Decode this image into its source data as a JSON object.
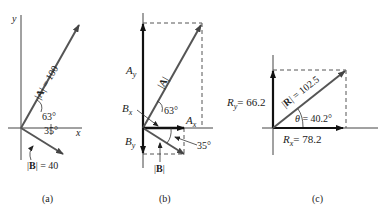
{
  "figure": {
    "panels": [
      {
        "id": "a",
        "caption": "(a)",
        "axis_labels": {
          "x": "x",
          "y": "y"
        },
        "vectors": [
          {
            "name": "A",
            "label": "|A| = 100",
            "magnitude": 100,
            "angle_deg": 63
          },
          {
            "name": "B",
            "label": "|B| = 40",
            "magnitude": 40,
            "angle_deg": -35
          }
        ],
        "angle_labels": [
          "63°",
          "35°"
        ],
        "labels": {
          "A_mag": "|A| = 100",
          "B_mag": "|B| = 40",
          "angle_A": "63°",
          "angle_B": "35°"
        }
      },
      {
        "id": "b",
        "caption": "(b)",
        "labels": {
          "Ay": "A",
          "Ay_sub": "y",
          "Bx": "B",
          "Bx_sub": "x",
          "Ax": "A",
          "Ax_sub": "x",
          "By": "B",
          "By_sub": "y",
          "A_mag": "|A|",
          "B_mag": "|B|",
          "angle_A": "63°",
          "angle_B": "35°"
        }
      },
      {
        "id": "c",
        "caption": "(c)",
        "labels": {
          "Ry": "R",
          "Ry_sub": "y",
          "Ry_val": "= 66.2",
          "Rx": "R",
          "Rx_sub": "x",
          "Rx_val": "= 78.2",
          "R_mag": "|R| = 102.5",
          "theta": "θ = 40.2°"
        },
        "values": {
          "Rx": 78.2,
          "Ry": 66.2,
          "R": 102.5,
          "theta_deg": 40.2
        }
      }
    ],
    "colors": {
      "vector": "#555555",
      "ink": "#222222",
      "dashed": "#555555"
    }
  }
}
